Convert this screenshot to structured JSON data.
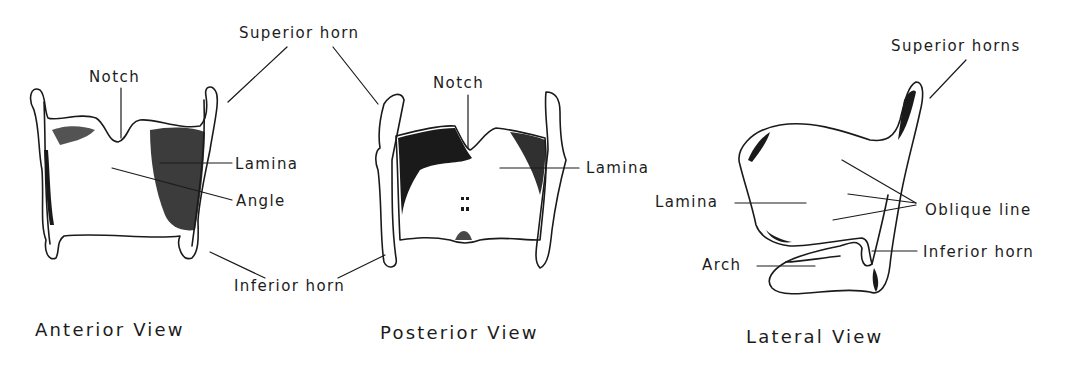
{
  "figure": {
    "panels": [
      {
        "id": "anterior",
        "caption": "Anterior View",
        "labels": {
          "notch": "Notch",
          "lamina": "Lamina",
          "angle": "Angle"
        }
      },
      {
        "id": "posterior",
        "caption": "Posterior View",
        "labels": {
          "notch": "Notch",
          "lamina": "Lamina"
        }
      },
      {
        "id": "lateral",
        "caption": "Lateral View",
        "labels": {
          "superior_horns": "Superior horns",
          "lamina": "Lamina",
          "oblique_line": "Oblique line",
          "inferior_horn": "Inferior horn",
          "arch": "Arch"
        }
      }
    ],
    "shared_labels": {
      "superior_horn": "Superior horn",
      "inferior_horn": "Inferior horn"
    },
    "colors": {
      "ink": "#1a1a1a",
      "background": "#ffffff"
    }
  }
}
